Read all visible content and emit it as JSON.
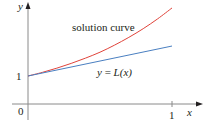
{
  "chart_data": {
    "type": "line",
    "title": "",
    "xlabel": "x",
    "ylabel": "y",
    "xlim": [
      0,
      1
    ],
    "ylim": [
      0,
      3.6
    ],
    "x_ticks": [
      {
        "value": 0,
        "label": "0"
      },
      {
        "value": 1,
        "label": "1"
      }
    ],
    "y_ticks": [
      {
        "value": 1,
        "label": "1"
      }
    ],
    "grid": false,
    "series": [
      {
        "name": "solution curve",
        "color": "#e0433a",
        "points": [
          [
            0,
            1
          ],
          [
            0.1,
            1.13
          ],
          [
            0.2,
            1.28
          ],
          [
            0.3,
            1.45
          ],
          [
            0.4,
            1.64
          ],
          [
            0.5,
            1.85
          ],
          [
            0.6,
            2.1
          ],
          [
            0.7,
            2.38
          ],
          [
            0.8,
            2.69
          ],
          [
            0.9,
            3.04
          ],
          [
            1.0,
            3.43
          ]
        ]
      },
      {
        "name": "y = L(x)",
        "color": "#4a7fc1",
        "points": [
          [
            0,
            1
          ],
          [
            1,
            2.07
          ]
        ]
      }
    ],
    "annotations": [
      {
        "text": "solution curve",
        "series": "solution curve"
      },
      {
        "text_prefix": "y",
        "text_eq": " = ",
        "text_func": "L",
        "text_arg": "(x)",
        "series": "y = L(x)"
      }
    ]
  },
  "colors": {
    "axis": "#7f7f7f",
    "text": "#231f20"
  }
}
